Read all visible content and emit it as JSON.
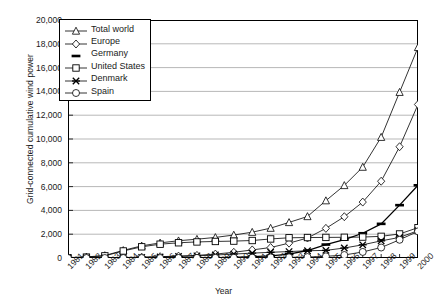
{
  "chart_data": {
    "type": "line",
    "title": "",
    "xlabel": "Year",
    "ylabel": "Grid-connected cumulative wind power",
    "x": [
      1981,
      1982,
      1983,
      1984,
      1985,
      1986,
      1987,
      1988,
      1989,
      1990,
      1991,
      1992,
      1993,
      1994,
      1995,
      1996,
      1997,
      1998,
      1999,
      2000
    ],
    "xlim": [
      1981,
      2000
    ],
    "ylim": [
      0,
      20000
    ],
    "ytick_labels": [
      "0",
      "2,000",
      "4,000",
      "6,000",
      "8,000",
      "10,000",
      "12,000",
      "14,000",
      "16,000",
      "18,000",
      "20,000"
    ],
    "ytick_values": [
      0,
      2000,
      4000,
      6000,
      8000,
      10000,
      12000,
      14000,
      16000,
      18000,
      20000
    ],
    "xtick_labels": [
      "1981",
      "1982",
      "1983",
      "1984",
      "1985",
      "1986",
      "1987",
      "1988",
      "1989",
      "1990",
      "1991",
      "1992",
      "1993",
      "1994",
      "1995",
      "1996",
      "1997",
      "1998",
      "1999",
      "2000"
    ],
    "grid": "horizontal",
    "legend_position": "top-left",
    "series": [
      {
        "name": "Total world",
        "marker": "triangle",
        "values": [
          30,
          90,
          210,
          640,
          1020,
          1270,
          1450,
          1580,
          1730,
          1930,
          2170,
          2510,
          2990,
          3490,
          4820,
          6100,
          7640,
          10150,
          13930,
          17700
        ]
      },
      {
        "name": "Europe",
        "marker": "diamond",
        "values": [
          5,
          10,
          20,
          40,
          70,
          110,
          160,
          220,
          330,
          480,
          680,
          880,
          1250,
          1680,
          2490,
          3470,
          4700,
          6450,
          9350,
          12900
        ]
      },
      {
        "name": "Germany",
        "marker": "line",
        "values": [
          0,
          0,
          0,
          5,
          10,
          15,
          20,
          25,
          30,
          60,
          110,
          180,
          330,
          630,
          1130,
          1550,
          2080,
          2870,
          4440,
          6110
        ]
      },
      {
        "name": "United States",
        "marker": "square",
        "values": [
          20,
          75,
          180,
          590,
          940,
          1160,
          1280,
          1350,
          1390,
          1420,
          1470,
          1600,
          1700,
          1720,
          1730,
          1740,
          1760,
          1820,
          2020,
          2550
        ]
      },
      {
        "name": "Denmark",
        "marker": "cross",
        "values": [
          5,
          10,
          15,
          20,
          50,
          90,
          130,
          180,
          250,
          330,
          410,
          480,
          540,
          610,
          640,
          840,
          1110,
          1440,
          1730,
          2300
        ]
      },
      {
        "name": "Spain",
        "marker": "circle",
        "values": [
          0,
          0,
          0,
          0,
          0,
          0,
          5,
          10,
          15,
          20,
          30,
          50,
          60,
          80,
          140,
          250,
          510,
          880,
          1530,
          2240
        ]
      }
    ]
  }
}
